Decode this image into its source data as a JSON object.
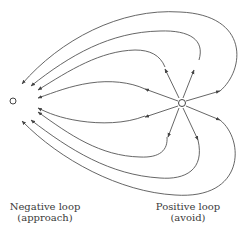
{
  "diagram": {
    "nodes": [
      {
        "id": "negative",
        "label_line1": "Negative loop",
        "label_line2": "(approach)"
      },
      {
        "id": "positive",
        "label_line1": "Positive loop",
        "label_line2": "(avoid)"
      }
    ],
    "colors": {
      "line": "#444444",
      "background": "#ffffff"
    }
  }
}
